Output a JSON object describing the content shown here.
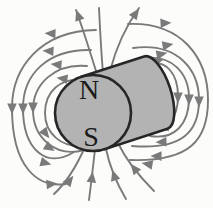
{
  "diagram": {
    "kind": "magnetic-field-of-cylindrical-magnet",
    "magnet": {
      "north_label": "N",
      "south_label": "S"
    },
    "field_lines": {
      "left_loops": 4,
      "right_loops": 4,
      "top_lines": 3,
      "bottom_lines": 4,
      "arrow_count": 28,
      "flow": "out of N at top, around the sides, into S at bottom"
    },
    "colors": {
      "background": "#fcfcfa",
      "field_line": "#7a7a7a",
      "arrowhead": "#7a7a7a",
      "magnet_fill": "#b3b3b3",
      "magnet_outline": "#262626",
      "label_color": "#1a1a1a"
    }
  }
}
